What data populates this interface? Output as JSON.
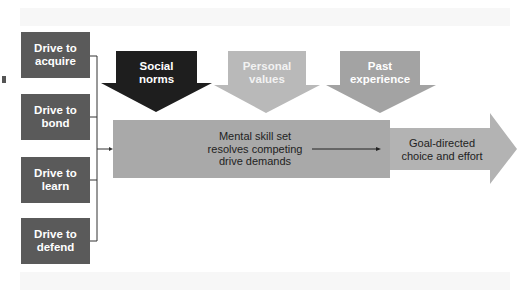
{
  "diagram": {
    "drives": [
      {
        "label": "Drive to\nacquire"
      },
      {
        "label": "Drive to\nbond"
      },
      {
        "label": "Drive to\nlearn"
      },
      {
        "label": "Drive to\ndefend"
      }
    ],
    "influences": [
      {
        "label": "Social\nnorms",
        "color": "#1e1e1e",
        "text_color": "#ffffff"
      },
      {
        "label": "Personal\nvalues",
        "color": "#b9b9b9",
        "text_color": "#f2f2f2"
      },
      {
        "label": "Past\nexperience",
        "color": "#a3a3a3",
        "text_color": "#ffffff"
      }
    ],
    "process": {
      "label": "Mental skill set\nresolves competing\ndrive demands",
      "color": "#a9a9a9"
    },
    "outcome": {
      "label": "Goal-directed\nchoice and effort",
      "color": "#b3b3b3"
    },
    "colors": {
      "drive_box": "#5a5a5a",
      "connector": "#333333"
    }
  }
}
